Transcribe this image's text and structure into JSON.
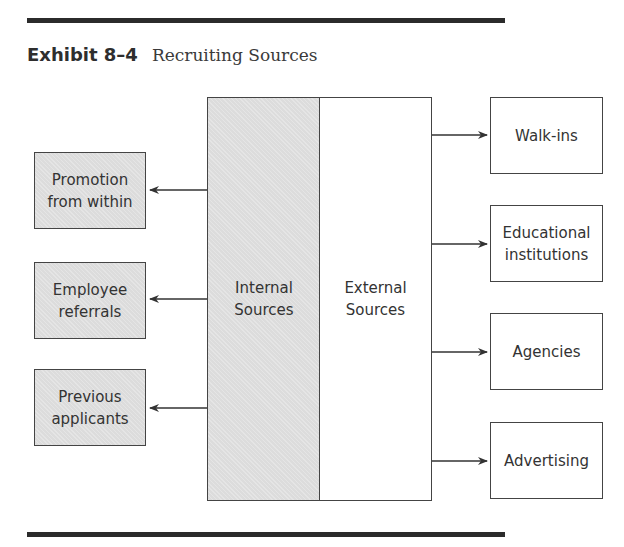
{
  "exhibit": {
    "number": "Exhibit 8–4",
    "title": "Recruiting Sources"
  },
  "center": {
    "internal_label": "Internal Sources",
    "external_label": "External Sources"
  },
  "internal_sources": [
    {
      "label": "Promotion from within"
    },
    {
      "label": "Employee referrals"
    },
    {
      "label": "Previous applicants"
    }
  ],
  "external_sources": [
    {
      "label": "Walk-ins"
    },
    {
      "label": "Educational institutions"
    },
    {
      "label": "Agencies"
    },
    {
      "label": "Advertising"
    }
  ],
  "colors": {
    "shaded_fill": "#dcdcdc",
    "line": "#444444",
    "rule": "#2b2b2b"
  }
}
